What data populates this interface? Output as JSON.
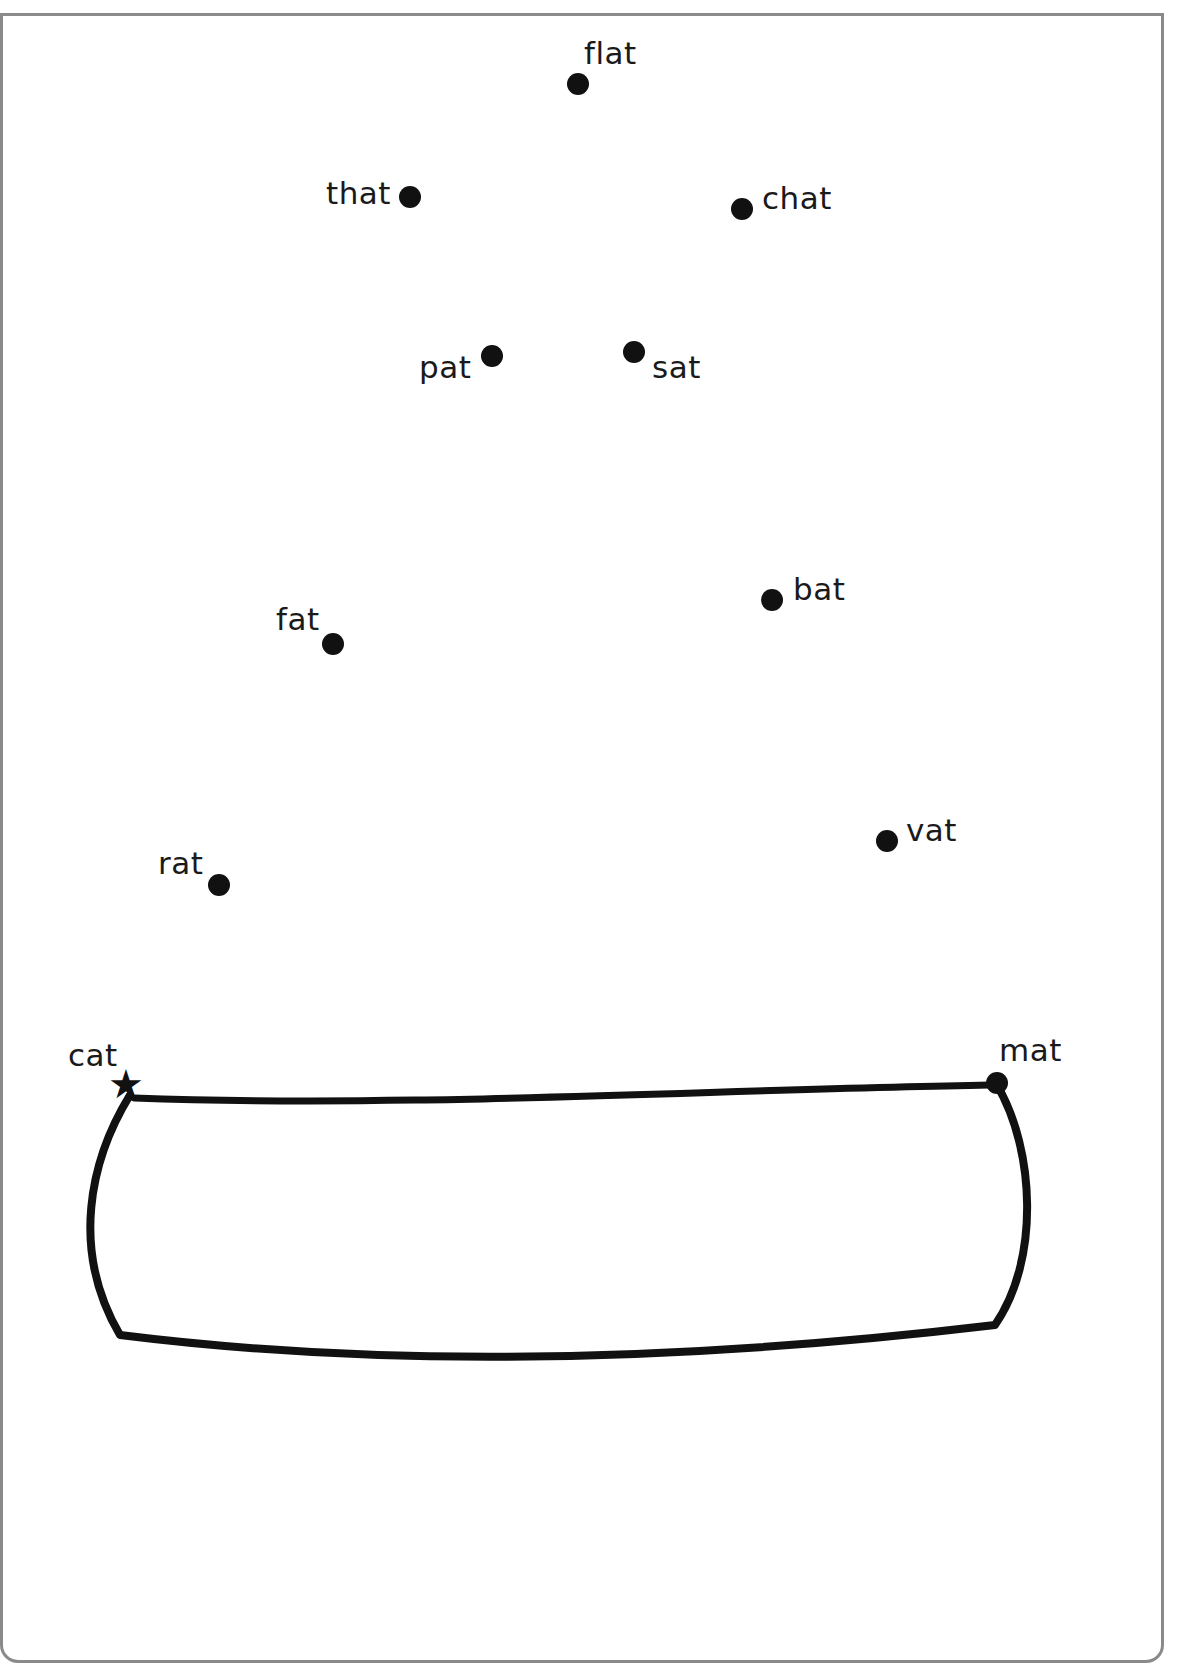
{
  "worksheet": {
    "type": "connect-the-dots word family -at",
    "start_label": "cat",
    "start_marker": "star-icon",
    "end_label": "mat",
    "colors": {
      "frame": "#8a8a8a",
      "ink": "#111111"
    }
  },
  "points": [
    {
      "word": "flat",
      "dot_x": 578,
      "dot_y": 84,
      "label_x": 584,
      "label_y": 38
    },
    {
      "word": "that",
      "dot_x": 410,
      "dot_y": 197,
      "label_x": 326,
      "label_y": 178
    },
    {
      "word": "chat",
      "dot_x": 742,
      "dot_y": 209,
      "label_x": 762,
      "label_y": 183
    },
    {
      "word": "pat",
      "dot_x": 492,
      "dot_y": 356,
      "label_x": 419,
      "label_y": 352
    },
    {
      "word": "sat",
      "dot_x": 634,
      "dot_y": 352,
      "label_x": 652,
      "label_y": 352
    },
    {
      "word": "fat",
      "dot_x": 333,
      "dot_y": 644,
      "label_x": 276,
      "label_y": 604
    },
    {
      "word": "bat",
      "dot_x": 772,
      "dot_y": 600,
      "label_x": 793,
      "label_y": 574
    },
    {
      "word": "rat",
      "dot_x": 219,
      "dot_y": 885,
      "label_x": 158,
      "label_y": 848
    },
    {
      "word": "vat",
      "dot_x": 887,
      "dot_y": 841,
      "label_x": 906,
      "label_y": 815
    },
    {
      "word": "cat",
      "dot_x": 127,
      "dot_y": 1085,
      "label_x": 68,
      "label_y": 1040
    },
    {
      "word": "mat",
      "dot_x": 997,
      "dot_y": 1083,
      "label_x": 999,
      "label_y": 1035
    }
  ]
}
